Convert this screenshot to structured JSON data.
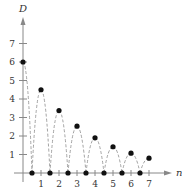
{
  "chart_data": {
    "type": "scatter",
    "title": "",
    "xlabel": "n",
    "ylabel": "D",
    "xlim": [
      0,
      7.5
    ],
    "ylim": [
      0,
      8
    ],
    "x_ticks": [
      "1",
      "2",
      "3",
      "4",
      "5",
      "6",
      "7"
    ],
    "y_ticks": [
      "1",
      "2",
      "3",
      "4",
      "5",
      "6",
      "7"
    ],
    "grid": false,
    "series": [
      {
        "name": "Points",
        "points": [
          {
            "x": 0,
            "y": 6
          },
          {
            "x": 0.5,
            "y": 0
          },
          {
            "x": 1,
            "y": 4.5
          },
          {
            "x": 1.5,
            "y": 0
          },
          {
            "x": 2,
            "y": 3.375
          },
          {
            "x": 2.5,
            "y": 0
          },
          {
            "x": 3,
            "y": 2.53
          },
          {
            "x": 3.5,
            "y": 0
          },
          {
            "x": 4,
            "y": 1.9
          },
          {
            "x": 4.5,
            "y": 0
          },
          {
            "x": 5,
            "y": 1.42
          },
          {
            "x": 5.5,
            "y": 0
          },
          {
            "x": 6,
            "y": 1.07
          },
          {
            "x": 6.5,
            "y": 0
          },
          {
            "x": 7,
            "y": 0.8
          }
        ]
      }
    ],
    "annotations": "Dashed parabolic arcs connect successive points (bouncing ball heights)"
  }
}
